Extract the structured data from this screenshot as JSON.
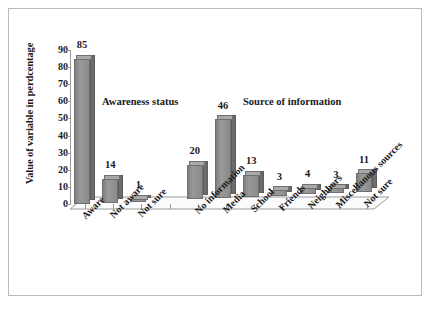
{
  "chart_data": {
    "type": "bar",
    "title": "",
    "subtitle": "",
    "xlabel": "",
    "ylabel": "Value of variable in perdcentage",
    "ylim": [
      0,
      90
    ],
    "ytick_labels": [
      "90",
      "80",
      "70",
      "60",
      "50",
      "40",
      "30",
      "20",
      "10",
      "0"
    ],
    "ytick_values": [
      90,
      80,
      70,
      60,
      50,
      40,
      30,
      20,
      10,
      0
    ],
    "grid": false,
    "legend": "none",
    "style": "3d-bar-grayscale",
    "bar_color": "#8e8e8e",
    "categories": [
      "Aware",
      "Not aware",
      "Not sure",
      "",
      "No information",
      "Media",
      "School",
      "Friends",
      "Neighbors",
      "Miscellanous sources",
      "Not sure"
    ],
    "values": [
      85,
      14,
      1,
      null,
      20,
      46,
      13,
      3,
      4,
      3,
      11
    ],
    "data_labels": [
      "85",
      "14",
      "1",
      "",
      "20",
      "46",
      "13",
      "3",
      "4",
      "3",
      "11"
    ],
    "annotations": [
      {
        "text": "Awareness status",
        "group": "awareness"
      },
      {
        "text": "Source of information",
        "group": "source"
      }
    ],
    "groups": [
      {
        "name": "Awareness status",
        "categories": [
          "Aware",
          "Not aware",
          "Not sure"
        ],
        "values": [
          85,
          14,
          1
        ]
      },
      {
        "name": "Source of information",
        "categories": [
          "No information",
          "Media",
          "School",
          "Friends",
          "Neighbors",
          "Miscellanous sources",
          "Not sure"
        ],
        "values": [
          20,
          46,
          13,
          3,
          4,
          3,
          11
        ]
      }
    ]
  }
}
